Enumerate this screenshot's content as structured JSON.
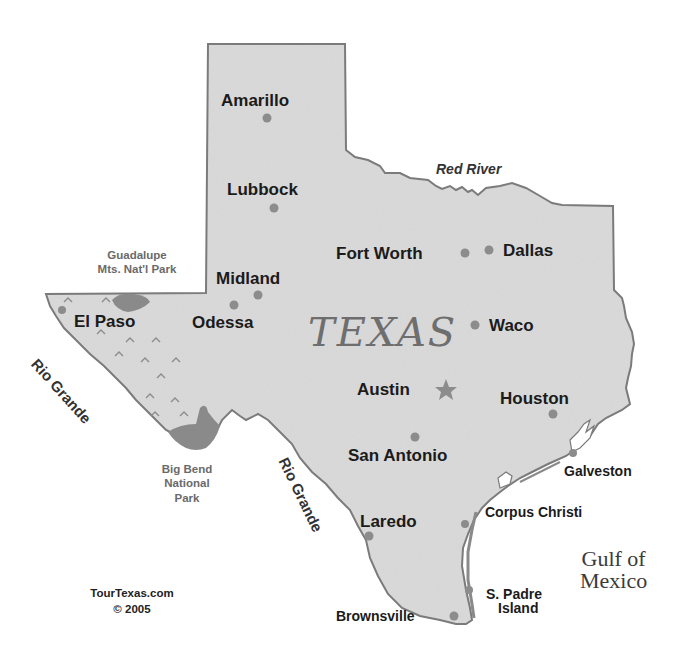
{
  "map": {
    "state_name": "TEXAS",
    "colors": {
      "land": "#d9d9d9",
      "border": "#7a7a7a",
      "city_dot": "#8c8c8c",
      "park_fill": "#8a8a8a",
      "background": "#ffffff"
    },
    "cities": [
      {
        "name": "Amarillo",
        "x": 267,
        "y": 118
      },
      {
        "name": "Lubbock",
        "x": 274,
        "y": 208
      },
      {
        "name": "Fort Worth",
        "x": 465,
        "y": 253
      },
      {
        "name": "Dallas",
        "x": 489,
        "y": 250
      },
      {
        "name": "Midland",
        "x": 258,
        "y": 295
      },
      {
        "name": "Odessa",
        "x": 234,
        "y": 305
      },
      {
        "name": "El Paso",
        "x": 62,
        "y": 312
      },
      {
        "name": "Waco",
        "x": 475,
        "y": 325
      },
      {
        "name": "Austin",
        "x": 446,
        "y": 390,
        "capital": true
      },
      {
        "name": "Houston",
        "x": 553,
        "y": 414
      },
      {
        "name": "San Antonio",
        "x": 415,
        "y": 437
      },
      {
        "name": "Galveston",
        "x": 573,
        "y": 453
      },
      {
        "name": "Corpus Christi",
        "x": 465,
        "y": 524
      },
      {
        "name": "Laredo",
        "x": 369,
        "y": 536
      },
      {
        "name": "S. Padre Island",
        "x": 469,
        "y": 590
      },
      {
        "name": "Brownsville",
        "x": 454,
        "y": 616
      }
    ],
    "parks": [
      {
        "line1": "Guadalupe",
        "line2": "Mts. Nat'l Park"
      },
      {
        "line1": "Big Bend",
        "line2": "National",
        "line3": "Park"
      }
    ],
    "rivers": [
      {
        "name": "Red River"
      },
      {
        "name": "Rio Grande"
      },
      {
        "name": "Rio Grande"
      }
    ],
    "water": {
      "line1": "Gulf of",
      "line2": "Mexico"
    },
    "credit": {
      "site": "TourTexas.com",
      "year": "© 2005"
    }
  }
}
